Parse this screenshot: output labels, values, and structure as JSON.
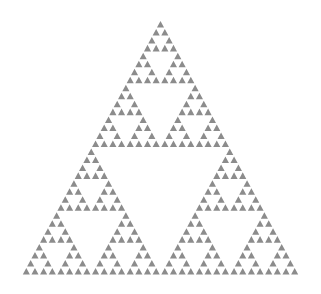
{
  "figure": {
    "type": "sierpinski-triangle",
    "depth": 5,
    "leaf_count": 243,
    "base_row_count": 32,
    "apex": [
      160.5,
      20
    ],
    "base_left": [
      22,
      275
    ],
    "base_right": [
      299,
      275
    ],
    "fill_color": "#8c8c8c",
    "background_color": "#ffffff",
    "leaf_scale": 0.82
  }
}
